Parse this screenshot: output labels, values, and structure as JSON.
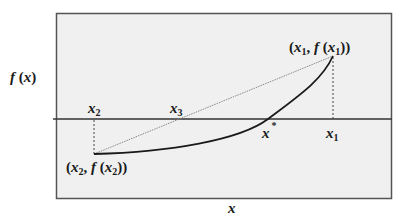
{
  "diagram": {
    "axis_labels": {
      "y": "f(x)",
      "x": "x"
    },
    "colors": {
      "frame_fill": "#f0f0f0",
      "frame_stroke": "#555555",
      "axis": "#333333",
      "curve": "#1a1a1a",
      "secant": "#888888",
      "guide": "#444444",
      "text": "#1a1a1a"
    },
    "points": {
      "x1": {
        "label": "x",
        "sub": "1",
        "point_label": "(x1, f(x1))"
      },
      "x2": {
        "label": "x",
        "sub": "2",
        "point_label": "(x2, f(x2))"
      },
      "x3": {
        "label": "x",
        "sub": "3"
      },
      "xstar": {
        "label": "x",
        "sup": "*"
      }
    },
    "elements": [
      "function curve f(x), concave-up, from (x2,f(x2)) below axis to (x1,f(x1)) above axis",
      "dotted secant line from (x2,f(x2)) to (x1,f(x1)) crossing axis at x3",
      "dotted vertical guides at x1 and x2",
      "root x* where curve crosses axis"
    ]
  }
}
